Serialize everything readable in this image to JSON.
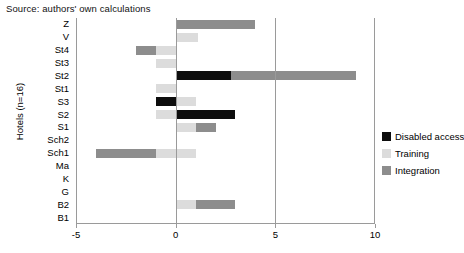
{
  "source_note": "Source: authors' own calculations",
  "axis": {
    "ylabel": "Hotels (n=16)",
    "xticks": [
      "-5",
      "0",
      "5",
      "10"
    ],
    "xtick_values": [
      -5,
      0,
      5,
      10
    ],
    "xmin": -5,
    "xmax": 10
  },
  "legend": {
    "items": [
      {
        "label": "Disabled access",
        "color": "#0d0d0d",
        "key": "disabled"
      },
      {
        "label": "Training",
        "color": "#dcdcdc",
        "key": "training"
      },
      {
        "label": "Integration",
        "color": "#8d8d8d",
        "key": "integration"
      }
    ]
  },
  "chart_data": {
    "type": "bar",
    "orientation": "horizontal",
    "stacked": true,
    "title": "",
    "subtitle": "",
    "xlabel": "",
    "ylabel": "Hotels (n=16)",
    "xlim": [
      -5,
      10
    ],
    "xticks": [
      -5,
      0,
      5,
      10
    ],
    "grid": false,
    "legend_position": "right",
    "categories": [
      "Z",
      "V",
      "St4",
      "St3",
      "St2",
      "St1",
      "S3",
      "S2",
      "S1",
      "Sch2",
      "Sch1",
      "Ma",
      "K",
      "G",
      "B2",
      "B1"
    ],
    "series": [
      {
        "name": "Disabled access",
        "color": "#0d0d0d",
        "values": [
          0,
          0,
          0,
          0,
          2.8,
          0,
          -1,
          3,
          0,
          0,
          0,
          0,
          0,
          0,
          0,
          0
        ]
      },
      {
        "name": "Training",
        "color": "#dcdcdc",
        "values": [
          0,
          1.1,
          -1,
          -1,
          0,
          -1,
          1,
          -1,
          1,
          0,
          1,
          0,
          0,
          0,
          1,
          0
        ]
      },
      {
        "name": "Integration",
        "color": "#8d8d8d",
        "values": [
          4,
          0,
          -1,
          0,
          6.25,
          0,
          0,
          0,
          1,
          0,
          -3,
          0,
          0,
          0,
          2,
          0
        ]
      }
    ],
    "bars": [
      {
        "category": "Z",
        "segments": [
          {
            "series": "Integration",
            "from": 0,
            "to": 4
          }
        ]
      },
      {
        "category": "V",
        "segments": [
          {
            "series": "Training",
            "from": 0,
            "to": 1.1
          }
        ]
      },
      {
        "category": "St4",
        "segments": [
          {
            "series": "Integration",
            "from": -2,
            "to": -1
          },
          {
            "series": "Training",
            "from": -1,
            "to": 0
          }
        ]
      },
      {
        "category": "St3",
        "segments": [
          {
            "series": "Training",
            "from": -1,
            "to": 0
          }
        ]
      },
      {
        "category": "St2",
        "segments": [
          {
            "series": "Disabled access",
            "from": 0,
            "to": 2.8
          },
          {
            "series": "Integration",
            "from": 2.8,
            "to": 9.05
          }
        ]
      },
      {
        "category": "St1",
        "segments": [
          {
            "series": "Training",
            "from": -1,
            "to": 0
          }
        ]
      },
      {
        "category": "S3",
        "segments": [
          {
            "series": "Disabled access",
            "from": -1,
            "to": 0
          },
          {
            "series": "Training",
            "from": 0,
            "to": 1
          }
        ]
      },
      {
        "category": "S2",
        "segments": [
          {
            "series": "Training",
            "from": -1,
            "to": 0
          },
          {
            "series": "Disabled access",
            "from": 0,
            "to": 3
          }
        ]
      },
      {
        "category": "S1",
        "segments": [
          {
            "series": "Training",
            "from": 0,
            "to": 1
          },
          {
            "series": "Integration",
            "from": 1,
            "to": 2
          }
        ]
      },
      {
        "category": "Sch2",
        "segments": []
      },
      {
        "category": "Sch1",
        "segments": [
          {
            "series": "Integration",
            "from": -4,
            "to": -1
          },
          {
            "series": "Training",
            "from": -1,
            "to": 1
          }
        ]
      },
      {
        "category": "Ma",
        "segments": []
      },
      {
        "category": "K",
        "segments": []
      },
      {
        "category": "G",
        "segments": []
      },
      {
        "category": "B2",
        "segments": [
          {
            "series": "Training",
            "from": 0,
            "to": 1
          },
          {
            "series": "Integration",
            "from": 1,
            "to": 3
          }
        ]
      },
      {
        "category": "B1",
        "segments": []
      }
    ]
  }
}
